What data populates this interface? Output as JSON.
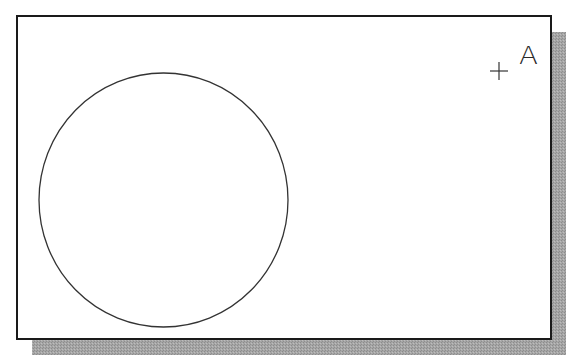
{
  "figure": {
    "frame": {
      "x": 17,
      "y": 16,
      "width": 534,
      "height": 323,
      "stroke": "#1a1a1a",
      "stroke_width": 2
    },
    "shadow": {
      "offset_x": 15,
      "offset_y": 16,
      "color": "#9a9a9a"
    },
    "circle": {
      "cx": 163.5,
      "cy": 200,
      "rx": 124.5,
      "ry": 127,
      "stroke": "#333333"
    },
    "point": {
      "marker": "+",
      "cx": 499,
      "cy": 71,
      "arm": 9,
      "label": "A",
      "label_x": 520,
      "label_y": 64
    }
  }
}
